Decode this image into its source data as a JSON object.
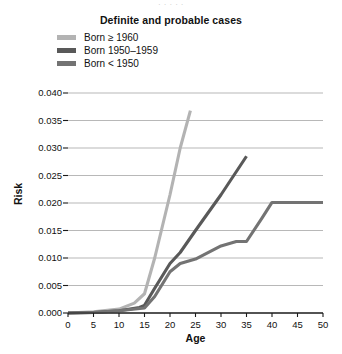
{
  "figure": {
    "top_cropped_text": "· · · · ·",
    "title": "Definite and probable cases",
    "xaxis_title": "Age",
    "yaxis_title": "Risk"
  },
  "legend": {
    "items": [
      {
        "label": "Born ≥ 1960",
        "color": "#b3b3b3",
        "series_key": "born_1960_plus"
      },
      {
        "label": "Born 1950–1959",
        "color": "#595959",
        "series_key": "born_1950_1959"
      },
      {
        "label": "Born < 1950",
        "color": "#737373",
        "series_key": "born_before_1950"
      }
    ]
  },
  "chart_data": {
    "type": "line",
    "title": "Definite and probable cases",
    "xlabel": "Age",
    "ylabel": "Risk",
    "xlim": [
      0,
      50
    ],
    "ylim": [
      0.0,
      0.04
    ],
    "xticks": [
      0,
      5,
      10,
      15,
      20,
      25,
      30,
      35,
      40,
      45,
      50
    ],
    "yticks": [
      0.0,
      0.005,
      0.01,
      0.015,
      0.02,
      0.025,
      0.03,
      0.035,
      0.04
    ],
    "ytick_labels": [
      "0.000",
      "0.005",
      "0.010",
      "0.015",
      "0.020",
      "0.025",
      "0.030",
      "0.035",
      "0.040"
    ],
    "xtick_labels": [
      "0",
      "5",
      "10",
      "15",
      "20",
      "25",
      "30",
      "35",
      "40",
      "45",
      "50"
    ],
    "grid": "horizontal",
    "legend_position": "top-left",
    "series": [
      {
        "name": "Born ≥ 1960",
        "color": "#b3b3b3",
        "x": [
          0,
          5,
          10,
          13,
          15,
          17,
          20,
          22,
          24
        ],
        "values": [
          0.0,
          0.0002,
          0.0007,
          0.0018,
          0.0035,
          0.01,
          0.0215,
          0.03,
          0.0368
        ]
      },
      {
        "name": "Born 1950–1959",
        "color": "#595959",
        "x": [
          0,
          5,
          10,
          14,
          15,
          17,
          20,
          22,
          25,
          30,
          35
        ],
        "values": [
          0.0,
          0.0001,
          0.0004,
          0.001,
          0.0014,
          0.0045,
          0.009,
          0.011,
          0.015,
          0.0215,
          0.0285
        ]
      },
      {
        "name": "Born < 1950",
        "color": "#737373",
        "x": [
          0,
          5,
          10,
          15,
          17,
          20,
          22,
          25,
          30,
          33,
          35,
          38,
          40,
          45,
          50
        ],
        "values": [
          0.0,
          0.0001,
          0.0004,
          0.0009,
          0.003,
          0.0075,
          0.009,
          0.0098,
          0.0122,
          0.013,
          0.013,
          0.0172,
          0.0201,
          0.0201,
          0.0201
        ]
      }
    ]
  }
}
